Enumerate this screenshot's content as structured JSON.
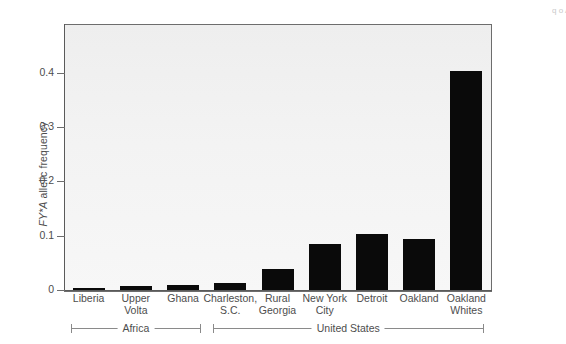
{
  "chart_data": {
    "type": "bar",
    "title": "",
    "xlabel": "",
    "ylabel": "FY*A allelic frequency",
    "ylabel_italic_part": "FY*A",
    "ylabel_plain_part": " allelic frequency",
    "ylim": [
      0,
      0.49
    ],
    "yticks": [
      0,
      0.1,
      0.2,
      0.3,
      0.4
    ],
    "ytick_labels": [
      "0",
      "0.1",
      "0.2",
      "0.3",
      "0.4"
    ],
    "grid": false,
    "legend": null,
    "bar_color": "#0a0a0a",
    "plot_background": "#f2f2f2",
    "categories": [
      "Liberia",
      "Upper Volta",
      "Ghana",
      "Charleston, S.C.",
      "Rural Georgia",
      "New York City",
      "Detroit",
      "Oakland",
      "Oakland Whites"
    ],
    "category_label_lines": [
      [
        "Liberia"
      ],
      [
        "Upper",
        "Volta"
      ],
      [
        "Ghana"
      ],
      [
        "Charleston,",
        "S.C."
      ],
      [
        "Rural",
        "Georgia"
      ],
      [
        "New York",
        "City"
      ],
      [
        "Detroit"
      ],
      [
        "Oakland"
      ],
      [
        "Oakland",
        "Whites"
      ]
    ],
    "values": [
      0.004,
      0.007,
      0.01,
      0.013,
      0.038,
      0.085,
      0.104,
      0.094,
      0.403
    ],
    "groups": [
      {
        "label": "Africa",
        "from": 0,
        "to": 2
      },
      {
        "label": "United States",
        "from": 3,
        "to": 8
      }
    ]
  },
  "edge_caption": {
    "text": "q o A"
  }
}
